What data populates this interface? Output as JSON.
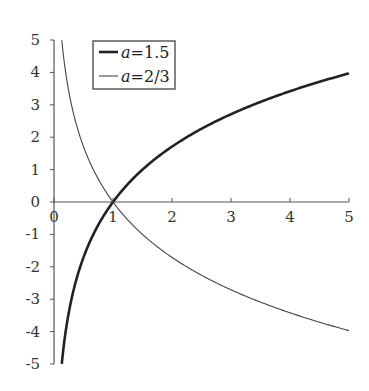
{
  "chart_data": {
    "type": "line",
    "title": "",
    "xlabel": "",
    "ylabel": "",
    "xlim": [
      0,
      5
    ],
    "ylim": [
      -5,
      5
    ],
    "grid": false,
    "legend_position": "upper left (inside)",
    "x_ticks": [
      "0",
      "1",
      "2",
      "3",
      "4",
      "5"
    ],
    "y_ticks": [
      "5",
      "4",
      "3",
      "2",
      "1",
      "0",
      "-1",
      "-2",
      "-3",
      "-4",
      "-5"
    ],
    "series": [
      {
        "name": "a=1.5",
        "label_var": "a",
        "label_val": "=1.5",
        "function": "log_1.5(x)",
        "line_width": "thick",
        "color": "#222222",
        "x": [
          0.132,
          0.25,
          0.5,
          0.75,
          1,
          1.5,
          2,
          2.5,
          3,
          3.5,
          4,
          4.5,
          5
        ],
        "values": [
          -5.0,
          -3.42,
          -1.71,
          -0.71,
          0,
          1.0,
          1.71,
          2.26,
          2.71,
          3.09,
          3.42,
          3.71,
          3.97
        ]
      },
      {
        "name": "a=2/3",
        "label_var": "a",
        "label_val": "=2/3",
        "function": "log_(2/3)(x)",
        "line_width": "thin",
        "color": "#444444",
        "x": [
          0.132,
          0.25,
          0.5,
          0.75,
          1,
          1.5,
          2,
          2.5,
          3,
          3.5,
          4,
          4.5,
          5
        ],
        "values": [
          5.0,
          3.42,
          1.71,
          0.71,
          0,
          -1.0,
          -1.71,
          -2.26,
          -2.71,
          -3.09,
          -3.42,
          -3.71,
          -3.97
        ]
      }
    ]
  }
}
